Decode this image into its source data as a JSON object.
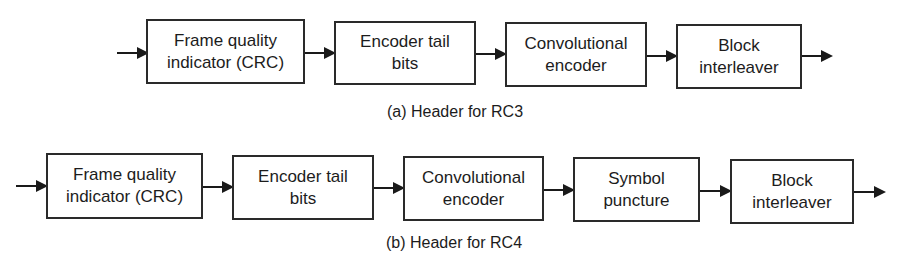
{
  "diagrams": [
    {
      "id": "rc3",
      "caption": "(a) Header for RC3",
      "blocks": [
        {
          "line1": "Frame quality",
          "line2": "indicator (CRC)"
        },
        {
          "line1": "Encoder tail",
          "line2": "bits"
        },
        {
          "line1": "Convolutional",
          "line2": "encoder"
        },
        {
          "line1": "Block",
          "line2": "interleaver"
        }
      ]
    },
    {
      "id": "rc4",
      "caption": "(b) Header for RC4",
      "blocks": [
        {
          "line1": "Frame quality",
          "line2": "indicator (CRC)"
        },
        {
          "line1": "Encoder tail",
          "line2": "bits"
        },
        {
          "line1": "Convolutional",
          "line2": "encoder"
        },
        {
          "line1": "Symbol",
          "line2": "puncture"
        },
        {
          "line1": "Block",
          "line2": "interleaver"
        }
      ]
    }
  ],
  "colors": {
    "stroke": "#2a2a2a",
    "text": "#1c1c1c",
    "background": "#ffffff"
  }
}
